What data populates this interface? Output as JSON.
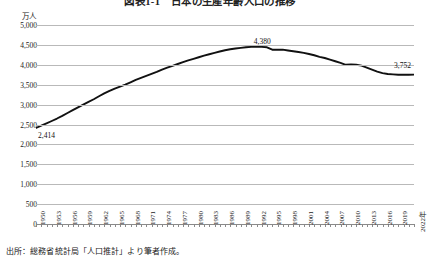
{
  "title": "図表1-1　日本の生産年齢人口の推移",
  "unit_label": "万人",
  "source_note": "出所：総務省統計局「人口推計」より筆者作成。",
  "axis_end_suffix": "年",
  "callouts": {
    "start": "2,414",
    "peak": "4,380",
    "end": "3,752"
  },
  "colors": {
    "line": "#111111",
    "grid": "#b9b9b9",
    "axis": "#8a8a8a",
    "text": "#222222",
    "background": "#ffffff"
  },
  "chart_data": {
    "type": "line",
    "title": "図表1-1　日本の生産年齢人口の推移",
    "xlabel": "年",
    "ylabel": "万人",
    "ylim": [
      0,
      5000
    ],
    "ytick_step": 500,
    "yticks": [
      "0",
      "500",
      "1,000",
      "1,500",
      "2,000",
      "2,500",
      "3,000",
      "3,500",
      "4,000",
      "4,500",
      "5,000"
    ],
    "xlim": [
      1950,
      2022
    ],
    "xtick_labels": [
      "1950",
      "1953",
      "1956",
      "1959",
      "1962",
      "1965",
      "1968",
      "1971",
      "1974",
      "1977",
      "1980",
      "1983",
      "1986",
      "1989",
      "1992",
      "1995",
      "1998",
      "2001",
      "2004",
      "2007",
      "2010",
      "2013",
      "2016",
      "2019",
      "2022年"
    ],
    "xtick_step": 3,
    "minor_ticks_every_year": true,
    "grid": true,
    "legend": null,
    "annotations": [
      {
        "x": 1950,
        "y": 2414,
        "label": "2,414"
      },
      {
        "x": 1995,
        "y": 4380,
        "label": "4,380"
      },
      {
        "x": 2022,
        "y": 3752,
        "label": "3,752"
      }
    ],
    "x": [
      1950,
      1951,
      1952,
      1953,
      1954,
      1955,
      1956,
      1957,
      1958,
      1959,
      1960,
      1961,
      1962,
      1963,
      1964,
      1965,
      1966,
      1967,
      1968,
      1969,
      1970,
      1971,
      1972,
      1973,
      1974,
      1975,
      1976,
      1977,
      1978,
      1979,
      1980,
      1981,
      1982,
      1983,
      1984,
      1985,
      1986,
      1987,
      1988,
      1989,
      1990,
      1991,
      1992,
      1993,
      1994,
      1995,
      1996,
      1997,
      1998,
      1999,
      2000,
      2001,
      2002,
      2003,
      2004,
      2005,
      2006,
      2007,
      2008,
      2009,
      2010,
      2011,
      2012,
      2013,
      2014,
      2015,
      2016,
      2017,
      2018,
      2019,
      2020,
      2021,
      2022
    ],
    "y": [
      2414,
      2470,
      2528,
      2588,
      2650,
      2718,
      2790,
      2862,
      2932,
      3000,
      3067,
      3135,
      3210,
      3280,
      3345,
      3403,
      3450,
      3500,
      3560,
      3620,
      3670,
      3720,
      3770,
      3820,
      3880,
      3930,
      3975,
      4020,
      4065,
      4110,
      4150,
      4190,
      4230,
      4265,
      4300,
      4335,
      4365,
      4390,
      4410,
      4425,
      4440,
      4450,
      4455,
      4450,
      4440,
      4380,
      4380,
      4380,
      4360,
      4340,
      4320,
      4300,
      4270,
      4240,
      4200,
      4170,
      4130,
      4090,
      4050,
      4000,
      4010,
      4000,
      3980,
      3930,
      3880,
      3830,
      3790,
      3770,
      3760,
      3750,
      3750,
      3750,
      3752
    ]
  }
}
